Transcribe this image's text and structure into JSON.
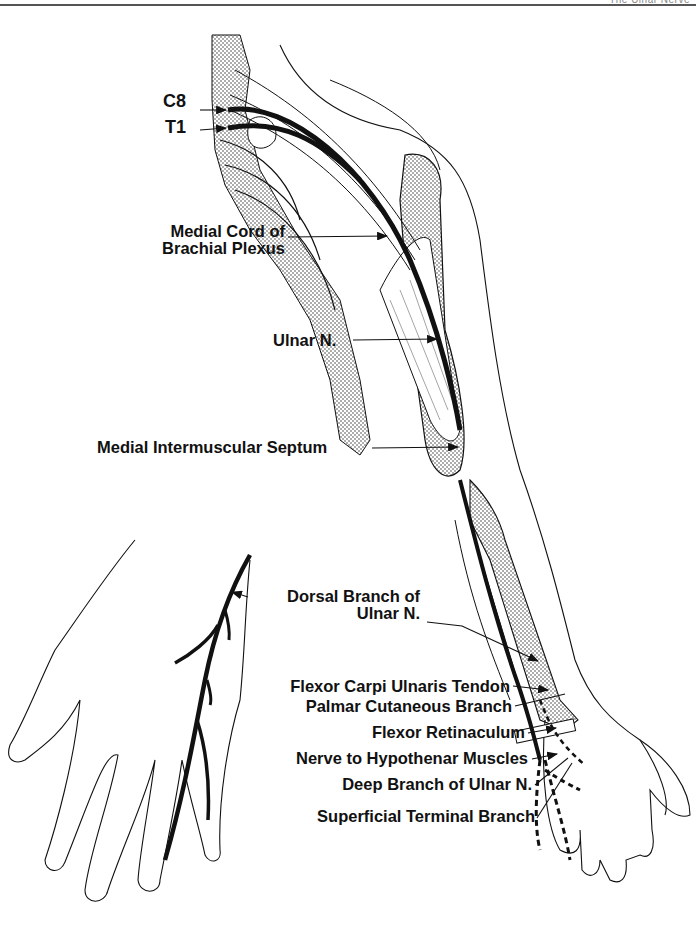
{
  "header": {
    "running_title": "The Ulnar Nerve"
  },
  "figure": {
    "colors": {
      "line": "#111111",
      "stipple_bone": "#cfcfcf",
      "background": "#ffffff"
    },
    "labels": {
      "c8": "C8",
      "t1": "T1",
      "medial_cord_line1": "Medial Cord of",
      "medial_cord_line2": "Brachial Plexus",
      "ulnar_n": "Ulnar N.",
      "medial_septum": "Medial Intermuscular Septum",
      "dorsal_branch_line1": "Dorsal Branch of",
      "dorsal_branch_line2": "Ulnar N.",
      "fcu_tendon": "Flexor Carpi Ulnaris Tendon",
      "palmar_cutaneous": "Palmar Cutaneous Branch",
      "flexor_retinaculum": "Flexor Retinaculum",
      "nerve_hypothenar": "Nerve to Hypothenar Muscles",
      "deep_branch": "Deep Branch of Ulnar N.",
      "superficial_terminal": "Superficial Terminal Branch"
    }
  }
}
